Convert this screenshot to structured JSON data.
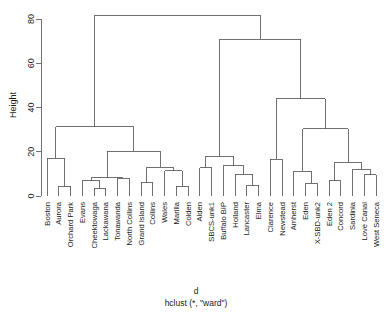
{
  "chart_data": {
    "type": "tree",
    "title": "d",
    "subtitle": "hclust (*, \"ward\")",
    "xlabel": "",
    "ylabel": "Height",
    "ylim": [
      0,
      85
    ],
    "yticks": [
      0,
      20,
      40,
      60,
      80
    ],
    "ytick_labels": [
      "0",
      "20",
      "40",
      "60",
      "80"
    ],
    "grid": false,
    "legend": "none",
    "method": "ward",
    "distance_object": "d",
    "leaf_count": 29,
    "leaves": [
      "Boston",
      "Aurora",
      "Orchard Park",
      "Evans",
      "Cheektowaga",
      "Lackawana",
      "Tonawanda",
      "North Collins",
      "Grand Island",
      "Collins",
      "Wales",
      "Marilla",
      "Colden",
      "Alden",
      "SBCS-unk1",
      "Buffalo BIP",
      "Holland",
      "Lancaster",
      "Elma",
      "Clarence",
      "Newstead",
      "Amherst",
      "Eden",
      "X-SBD-unk2",
      "Eden 2",
      "Concord",
      "Sardinia",
      "Love Canal",
      "West Seneca"
    ],
    "merges": [
      {
        "id": "m1",
        "left": "Aurora",
        "right": "Orchard Park",
        "height": 4.5
      },
      {
        "id": "m2",
        "left": "Boston",
        "right": "m1",
        "height": 17.0
      },
      {
        "id": "m3",
        "left": "Cheektowaga",
        "right": "Lackawana",
        "height": 3.4
      },
      {
        "id": "m4",
        "left": "Evans",
        "right": "m3",
        "height": 6.8
      },
      {
        "id": "m5",
        "left": "Tonawanda",
        "right": "North Collins",
        "height": 8.0
      },
      {
        "id": "m6",
        "left": "m4",
        "right": "m5",
        "height": 8.3
      },
      {
        "id": "m7",
        "left": "Grand Island",
        "right": "Collins",
        "height": 6.2
      },
      {
        "id": "m8",
        "left": "Marilla",
        "right": "Colden",
        "height": 4.5
      },
      {
        "id": "m9",
        "left": "Wales",
        "right": "m8",
        "height": 11.3
      },
      {
        "id": "m10",
        "left": "m7",
        "right": "m9",
        "height": 13.0
      },
      {
        "id": "m11",
        "left": "m6",
        "right": "m10",
        "height": 20.2
      },
      {
        "id": "m12",
        "left": "m2",
        "right": "m11",
        "height": 31.3
      },
      {
        "id": "m13",
        "left": "Alden",
        "right": "SBCS-unk1",
        "height": 12.8
      },
      {
        "id": "m14",
        "left": "Lancaster",
        "right": "Elma",
        "height": 4.8
      },
      {
        "id": "m15",
        "left": "Holland",
        "right": "m14",
        "height": 9.9
      },
      {
        "id": "m16",
        "left": "Buffalo BIP",
        "right": "m15",
        "height": 13.7
      },
      {
        "id": "m17",
        "left": "m13",
        "right": "m16",
        "height": 17.9
      },
      {
        "id": "m18",
        "left": "Clarence",
        "right": "Newstead",
        "height": 16.5
      },
      {
        "id": "m19",
        "left": "Eden",
        "right": "X-SBD-unk2",
        "height": 5.7
      },
      {
        "id": "m20",
        "left": "Amherst",
        "right": "m19",
        "height": 11.1
      },
      {
        "id": "m21",
        "left": "Eden 2",
        "right": "Concord",
        "height": 6.8
      },
      {
        "id": "m22",
        "left": "Love Canal",
        "right": "West Seneca",
        "height": 9.6
      },
      {
        "id": "m23",
        "left": "Sardinia",
        "right": "m22",
        "height": 12.0
      },
      {
        "id": "m24",
        "left": "m21",
        "right": "m23",
        "height": 15.2
      },
      {
        "id": "m25",
        "left": "m20",
        "right": "m24",
        "height": 30.4
      },
      {
        "id": "m26",
        "left": "m18",
        "right": "m25",
        "height": 44.0
      },
      {
        "id": "m27",
        "left": "m17",
        "right": "m26",
        "height": 70.8
      },
      {
        "id": "m28",
        "left": "m12",
        "right": "m27",
        "height": 81.7
      }
    ]
  },
  "axes": {
    "y_title": "Height"
  },
  "titles": {
    "main": "d",
    "sub": "hclust (*, \"ward\")"
  }
}
